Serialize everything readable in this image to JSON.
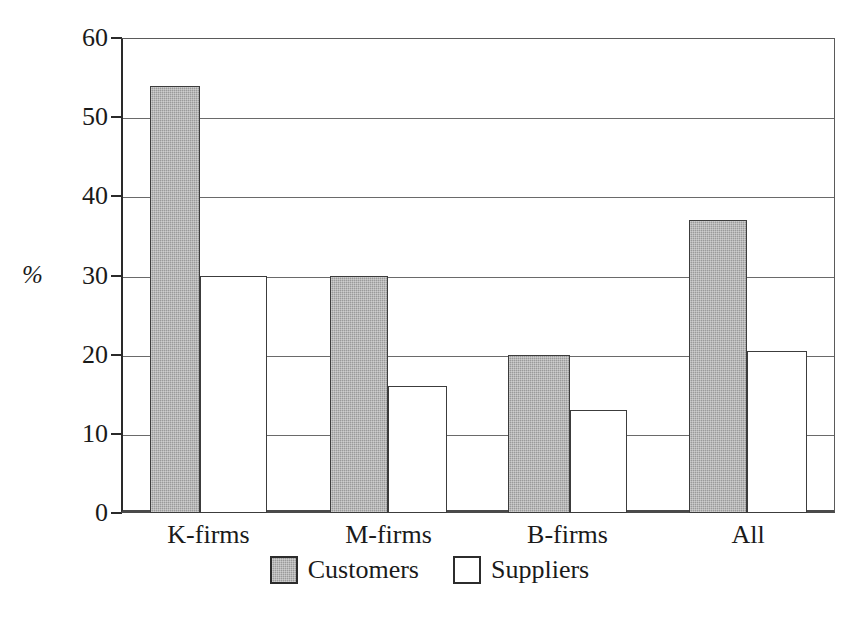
{
  "chart_data": {
    "type": "bar",
    "title": "",
    "subtitle": "",
    "xlabel": "",
    "ylabel": "%",
    "categories": [
      "K-firms",
      "M-firms",
      "B-firms",
      "All"
    ],
    "series": [
      {
        "name": "Customers",
        "color": "#9a9a9a",
        "values": [
          54,
          30,
          20,
          37
        ]
      },
      {
        "name": "Suppliers",
        "color": "#ffffff",
        "values": [
          30,
          16,
          13,
          20.5
        ]
      }
    ],
    "ylim": [
      0,
      60
    ],
    "ytick_labels": [
      "0",
      "10",
      "20",
      "30",
      "40",
      "50",
      "60"
    ],
    "ytick_values": [
      0,
      10,
      20,
      30,
      40,
      50,
      60
    ],
    "grid": "horizontal",
    "legend_position": "bottom-center",
    "annotations": []
  },
  "axis": {
    "y_title": "%"
  },
  "legend": {
    "items": [
      {
        "label": "Customers",
        "swatch": "filled-gray-square"
      },
      {
        "label": "Suppliers",
        "swatch": "empty-white-square"
      }
    ]
  }
}
